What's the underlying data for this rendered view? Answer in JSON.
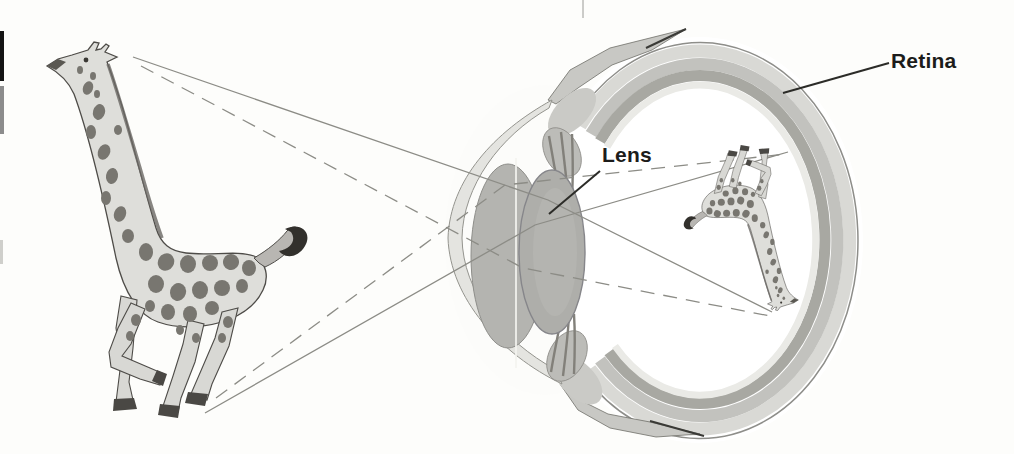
{
  "figure": {
    "labels": {
      "lens": "Lens",
      "retina": "Retina"
    },
    "colors": {
      "background": "#fdfdfb",
      "label_text": "#1c1c1a",
      "pointer_line": "#2c2c28",
      "light_ray": "#8c8c86",
      "sclera_band": "#d9d9d5",
      "choroid_band": "#c2c2be",
      "retina_band": "#a8a8a2",
      "inner_highlight": "#eaeae6",
      "cornea_fill": "#e4e4e0",
      "iris_fill": "#b4b4b0",
      "lens_fill": "#aeaeaa",
      "flap_fill": "#c8c8c4",
      "giraffe_body": "#dededa",
      "giraffe_spots": "#787670",
      "hoof_dark": "#4a4844"
    }
  }
}
